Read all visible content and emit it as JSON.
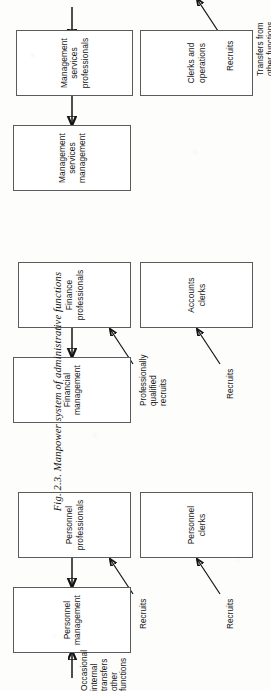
{
  "figure": {
    "caption_prefix": "Fig. 2.3.",
    "caption_text": "Manpower system of administrative functions",
    "caption_full": "Fig. 2.3.  Manpower system of administrative functions",
    "orientation": "rotated-90-ccw",
    "line_color": "#141414",
    "box_border_color": "#5b5b5b",
    "page_background": "#fdfdfc"
  },
  "columns": [
    {
      "id": "personnel",
      "name": "Personnel"
    },
    {
      "id": "financial",
      "name": "Financial"
    },
    {
      "id": "management-services",
      "name": "Management services"
    }
  ],
  "boxes": [
    {
      "id": "personnel-management",
      "label": "Personnel\nmanagement",
      "column": "personnel",
      "tier": "management"
    },
    {
      "id": "personnel-professionals",
      "label": "Personnel\nprofessionals",
      "column": "personnel",
      "tier": "professional"
    },
    {
      "id": "personnel-clerks",
      "label": "Personnel\nclerks",
      "column": "personnel",
      "tier": "clerical"
    },
    {
      "id": "financial-management",
      "label": "Financial\nmanagement",
      "column": "financial",
      "tier": "management"
    },
    {
      "id": "finance-professionals",
      "label": "Finance\nprofessionals",
      "column": "financial",
      "tier": "professional"
    },
    {
      "id": "accounts-clerks",
      "label": "Accounts\nclerks",
      "column": "financial",
      "tier": "clerical"
    },
    {
      "id": "management-services-management",
      "label": "Management\nservices\nmanagement",
      "column": "management-services",
      "tier": "management"
    },
    {
      "id": "management-services-professionals",
      "label": "Management\nservices\nprofessionals",
      "column": "management-services",
      "tier": "professional"
    },
    {
      "id": "clerks-and-operations",
      "label": "Clerks and\noperations",
      "column": "management-services",
      "tier": "clerical"
    }
  ],
  "flow_labels": [
    {
      "id": "occasional-internal-transfers",
      "text": "Occasional\ninternal transfers\nother functions",
      "target": "personnel-management"
    },
    {
      "id": "recruits-personnel-professionals",
      "text": "Recruits",
      "target": "personnel-professionals"
    },
    {
      "id": "recruits-personnel-clerks",
      "text": "Recruits",
      "target": "personnel-clerks"
    },
    {
      "id": "professionally-qualified-recruits",
      "text": "Professionally\nqualified\nrecruits",
      "target": "finance-professionals"
    },
    {
      "id": "recruits-accounts-clerks",
      "text": "Recruits",
      "target": "accounts-clerks"
    },
    {
      "id": "recruits-clerks-and-operations",
      "text": "Recruits",
      "target": "clerks-and-operations"
    },
    {
      "id": "transfers-from-other-functions",
      "text": "Transfers from\nother functions",
      "target": "management-services-professionals"
    }
  ]
}
